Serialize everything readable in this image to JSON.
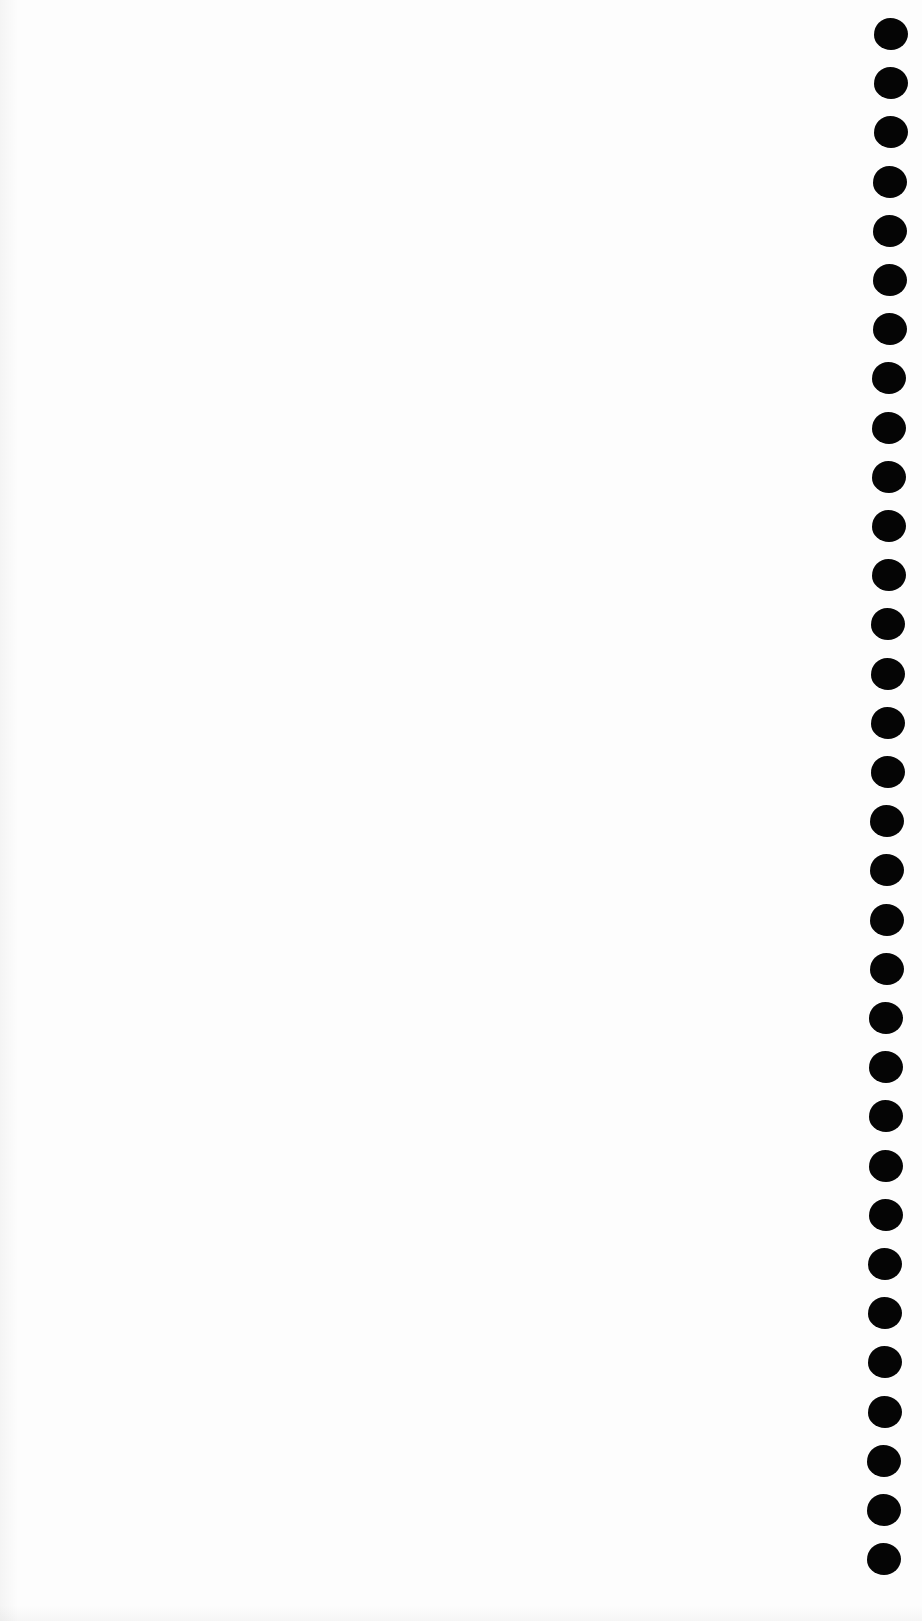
{
  "page": {
    "type": "blank-paper-scan",
    "background_color": "#fdfdfd",
    "text_content": []
  },
  "punch_holes": {
    "count": 32,
    "color": "#050505",
    "width": 34,
    "height": 32,
    "first_center_y": 34,
    "spacing_y": 49.2,
    "center_x_top": 891,
    "center_x_bottom": 884
  }
}
